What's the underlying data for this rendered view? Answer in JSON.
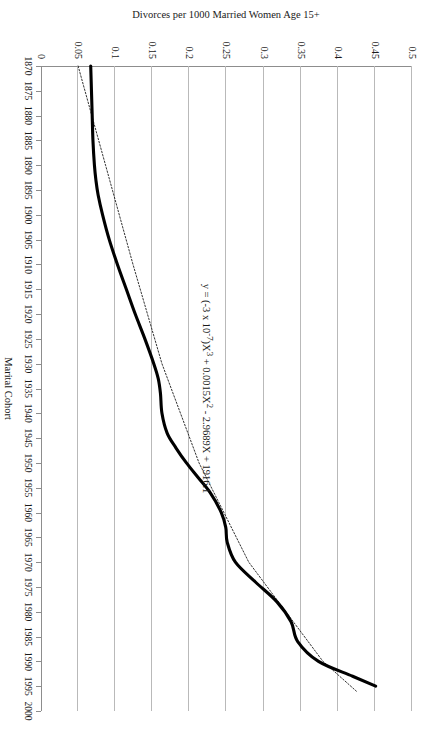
{
  "chart_data": {
    "type": "line",
    "title": "",
    "xlabel": "Marital Cohort",
    "ylabel": "Divorces per 1000 Married Women Age 15+",
    "xlim": [
      1870,
      2000
    ],
    "ylim": [
      0,
      0.5
    ],
    "grid": true,
    "legend": "none",
    "orientation": "page rotated 90 degrees clockwise",
    "xticks": [
      1870,
      1875,
      1880,
      1885,
      1890,
      1895,
      1900,
      1905,
      1910,
      1915,
      1920,
      1925,
      1930,
      1935,
      1940,
      1945,
      1950,
      1955,
      1960,
      1965,
      1970,
      1975,
      1980,
      1985,
      1990,
      1995,
      2000
    ],
    "yticks": [
      0,
      0.05,
      0.1,
      0.15,
      0.2,
      0.25,
      0.3,
      0.35,
      0.4,
      0.45,
      0.5
    ],
    "ytick_labels": [
      "0",
      "0.05",
      "0.1",
      "0.15",
      "0.2",
      "0.25",
      "0.3",
      "0.35",
      "0.4",
      "0.45",
      "0.5"
    ],
    "annotations": [
      {
        "name": "trendline-equation",
        "text": "y = (-3 x 10-7)X3 + 0.0015X2 - 2.9689X + 1916.1",
        "text_parts": {
          "lead": "y = (-3 x 10",
          "exp1": "-7",
          "mid1": ")X",
          "exp2": "3",
          "mid2": " + 0.0015X",
          "exp3": "2",
          "tail": " - 2.9689X + 1916.1"
        },
        "x": 1935,
        "y": 0.225
      }
    ],
    "series": [
      {
        "name": "observed divorce rate",
        "style": "solid thick black line",
        "x": [
          1870,
          1875,
          1880,
          1885,
          1890,
          1893,
          1896,
          1900,
          1905,
          1910,
          1915,
          1920,
          1925,
          1930,
          1933,
          1936,
          1940,
          1944,
          1947,
          1950,
          1953,
          1956,
          1960,
          1963,
          1966,
          1970,
          1974,
          1978,
          1982,
          1986,
          1990,
          1993,
          1995
        ],
        "y": [
          0.067,
          0.068,
          0.069,
          0.07,
          0.072,
          0.074,
          0.077,
          0.083,
          0.092,
          0.103,
          0.115,
          0.127,
          0.14,
          0.152,
          0.158,
          0.161,
          0.163,
          0.17,
          0.182,
          0.196,
          0.212,
          0.228,
          0.243,
          0.249,
          0.251,
          0.262,
          0.289,
          0.318,
          0.337,
          0.346,
          0.374,
          0.42,
          0.451
        ]
      },
      {
        "name": "cubic trendline",
        "style": "dotted thin black line",
        "x": [
          1870,
          1890,
          1910,
          1930,
          1950,
          1970,
          1990,
          1996
        ],
        "y": [
          0.05,
          0.087,
          0.124,
          0.163,
          0.213,
          0.28,
          0.38,
          0.425
        ]
      }
    ]
  },
  "labels": {
    "xaxis_title": "Marital Cohort",
    "yaxis_title": "Divorces per 1000 Married Women Age 15+"
  },
  "colors": {
    "series": "#000000",
    "trendline": "#1a1a1a",
    "grid": "#b9b9b9",
    "axis": "#8d8d8d",
    "background": "#ffffff"
  }
}
